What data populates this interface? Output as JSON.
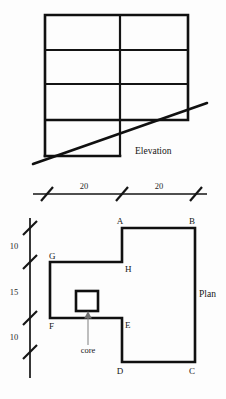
{
  "sheet": {
    "background": "#fdfdfd",
    "ink": "#141414",
    "width": 226,
    "height": 399
  },
  "elevation": {
    "title": "Elevation",
    "description": "Framed elevation grid, two bays wide and four storeys tall, with sloping ground line",
    "bays": 2,
    "storeys": 4,
    "frame": {
      "x_left": 45,
      "x_mid": 120,
      "x_right": 188,
      "y_top": 15,
      "y_bottom": 156
    },
    "floor_levels_y": [
      15,
      50,
      84,
      120,
      156
    ],
    "ground_line": {
      "x1": 33,
      "y1": 164,
      "x2": 207,
      "y2": 103
    }
  },
  "plan": {
    "title": "Plan",
    "core_label": "core",
    "vertices": [
      {
        "id": "A",
        "x": 122,
        "y": 228,
        "label_dx": -2,
        "label_dy": -4
      },
      {
        "id": "B",
        "x": 195,
        "y": 228,
        "label_dx": -3,
        "label_dy": -4
      },
      {
        "id": "C",
        "x": 195,
        "y": 362,
        "label_dx": -3,
        "label_dy": 12
      },
      {
        "id": "D",
        "x": 122,
        "y": 362,
        "label_dx": -2,
        "label_dy": 12
      },
      {
        "id": "E",
        "x": 122,
        "y": 318,
        "label_dx": 3,
        "label_dy": 10
      },
      {
        "id": "F",
        "x": 50,
        "y": 318,
        "label_dx": -1,
        "label_dy": 10
      },
      {
        "id": "G",
        "x": 50,
        "y": 262,
        "label_dx": -1,
        "label_dy": -3
      },
      {
        "id": "H",
        "x": 122,
        "y": 262,
        "label_dx": 3,
        "label_dy": 10
      }
    ],
    "outline_path": "M122,228 L195,228 L195,362 L122,362 L122,318 L50,318 L50,262 L122,262 Z",
    "core": {
      "x": 76,
      "y": 291,
      "width": 22,
      "height": 20
    },
    "core_leader": {
      "x1": 88,
      "y1": 345,
      "x2": 88,
      "y2": 314
    }
  },
  "dimensions": {
    "horizontal": {
      "line": {
        "x1": 33,
        "y1": 194,
        "x2": 207,
        "y2": 194
      },
      "ticks_x": [
        47,
        122,
        196
      ],
      "labels": [
        {
          "value": "20",
          "x": 84,
          "y": 189
        },
        {
          "value": "20",
          "x": 159,
          "y": 189
        }
      ]
    },
    "vertical": {
      "line": {
        "x1": 30,
        "y1": 218,
        "x2": 30,
        "y2": 378
      },
      "ticks_y": [
        228,
        262,
        318,
        352
      ],
      "labels": [
        {
          "value": "10",
          "x": 16,
          "y": 248
        },
        {
          "value": "15",
          "x": 16,
          "y": 294
        },
        {
          "value": "10",
          "x": 16,
          "y": 339
        }
      ]
    }
  }
}
